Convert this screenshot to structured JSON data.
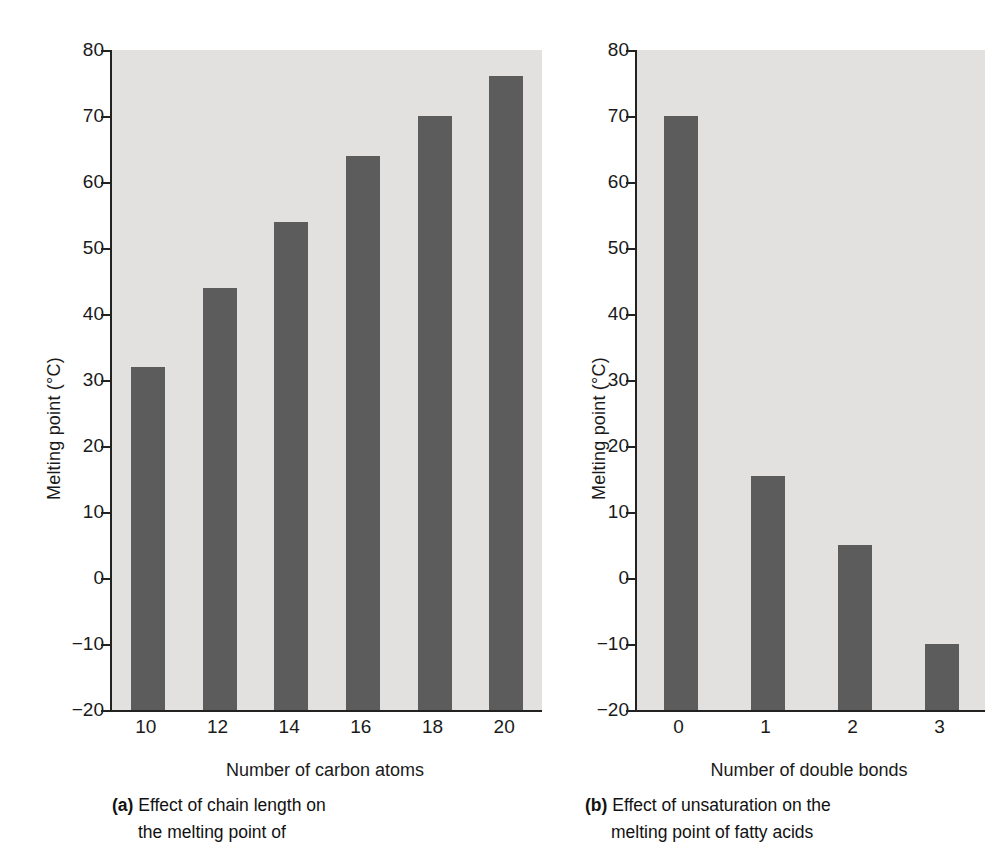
{
  "figure": {
    "bar_color": "#5c5c5c",
    "plot_background": "#e3e1df",
    "axis_color": "#222222"
  },
  "panel_a": {
    "ylabel": "Melting point (°C)",
    "xtitle": "Number of carbon atoms",
    "ytick_labels": [
      "80",
      "70",
      "60",
      "50",
      "40",
      "30",
      "20",
      "10",
      "0",
      "−10",
      "−20"
    ],
    "xtick_labels": [
      "10",
      "12",
      "14",
      "16",
      "18",
      "20"
    ],
    "caption_tag": "(a)",
    "caption_line1": "Effect of chain length on",
    "caption_line2": "the melting point of"
  },
  "panel_b": {
    "ylabel": "Melting point (°C)",
    "xtitle": "Number of double bonds",
    "ytick_labels": [
      "80",
      "70",
      "60",
      "50",
      "40",
      "30",
      "20",
      "10",
      "0",
      "−10",
      "−20"
    ],
    "xtick_labels": [
      "0",
      "1",
      "2",
      "3"
    ],
    "caption_tag": "(b)",
    "caption_line1": "Effect of unsaturation on the",
    "caption_line2": "melting point of fatty acids"
  },
  "chart_data": [
    {
      "type": "bar",
      "panel": "a",
      "title": "Effect of chain length on the melting point of",
      "xlabel": "Number of carbon atoms",
      "ylabel": "Melting point (°C)",
      "categories": [
        "10",
        "12",
        "14",
        "16",
        "18",
        "20"
      ],
      "values": [
        32,
        44,
        54,
        64,
        70,
        76
      ],
      "ylim": [
        -20,
        80
      ],
      "ytick_values": [
        80,
        70,
        60,
        50,
        40,
        30,
        20,
        10,
        0,
        -10,
        -20
      ],
      "grid": false,
      "legend": "none"
    },
    {
      "type": "bar",
      "panel": "b",
      "title": "Effect of unsaturation on the melting point of fatty acids",
      "xlabel": "Number of double bonds",
      "ylabel": "Melting point (°C)",
      "categories": [
        "0",
        "1",
        "2",
        "3"
      ],
      "values": [
        70,
        15.5,
        5,
        -10
      ],
      "ylim": [
        -20,
        80
      ],
      "ytick_values": [
        80,
        70,
        60,
        50,
        40,
        30,
        20,
        10,
        0,
        -10,
        -20
      ],
      "grid": false,
      "legend": "none"
    }
  ]
}
